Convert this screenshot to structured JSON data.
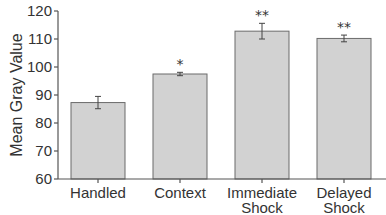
{
  "chart_data": {
    "type": "bar",
    "title": "",
    "xlabel": "",
    "ylabel": "Mean Gray Value",
    "ylim": [
      60,
      120
    ],
    "yticks": [
      60,
      70,
      80,
      90,
      100,
      110,
      120
    ],
    "categories": [
      "Handled",
      "Context",
      "Immediate Shock",
      "Delayed Shock"
    ],
    "category_lines": [
      [
        "Handled"
      ],
      [
        "Context"
      ],
      [
        "Immediate",
        "Shock"
      ],
      [
        "Delayed",
        "Shock"
      ]
    ],
    "values": [
      87.3,
      97.5,
      112.8,
      110.2
    ],
    "errors": [
      2.2,
      0.6,
      2.8,
      1.2
    ],
    "significance": [
      "",
      "*",
      "**",
      "**"
    ],
    "grid": false,
    "legend": null,
    "colors": {
      "bar_fill": "#d2d2d2",
      "bar_edge": "#6b6b6b",
      "axis": "#555555",
      "text": "#333333"
    }
  }
}
